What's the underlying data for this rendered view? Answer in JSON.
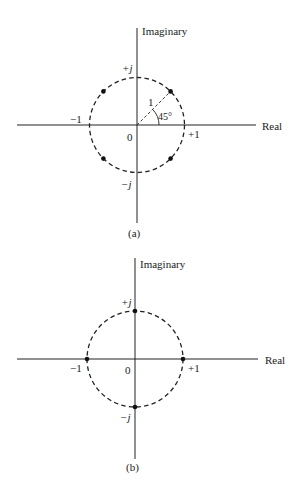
{
  "colors": {
    "ink": "#222222",
    "background": "#ffffff"
  },
  "diagrams": [
    {
      "id": "a",
      "caption": "(a)",
      "axis_labels": {
        "vertical": "Imaginary",
        "horizontal": "Real"
      },
      "tick_labels": {
        "plus_j": "+j",
        "minus_j": "−j",
        "minus_one": "−1",
        "plus_one": "+1",
        "origin": "0"
      },
      "radius_label": "1",
      "angle_label": "45°",
      "points": [
        {
          "angle_deg": 45,
          "label": ""
        },
        {
          "angle_deg": 135,
          "label": ""
        },
        {
          "angle_deg": 225,
          "label": ""
        },
        {
          "angle_deg": 315,
          "label": ""
        }
      ]
    },
    {
      "id": "b",
      "caption": "(b)",
      "axis_labels": {
        "vertical": "Imaginary",
        "horizontal": "Real"
      },
      "tick_labels": {
        "plus_j": "+j",
        "minus_j": "−j",
        "minus_one": "−1",
        "plus_one": "+1",
        "origin": "0"
      },
      "points": [
        {
          "angle_deg": 0,
          "label": ""
        },
        {
          "angle_deg": 90,
          "label": ""
        },
        {
          "angle_deg": 180,
          "label": ""
        },
        {
          "angle_deg": 270,
          "label": ""
        }
      ]
    }
  ]
}
